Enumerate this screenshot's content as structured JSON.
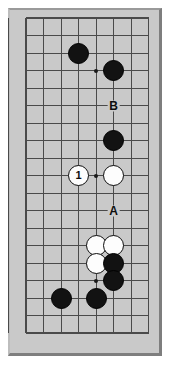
{
  "diagram": {
    "kind": "go-board-diagram",
    "board_color": "#c9c9c9",
    "line_color": "#4a4a4a",
    "black_stone_color": "#121212",
    "white_stone_color": "#fdfdfd",
    "width": 172,
    "height": 371,
    "grid": {
      "origin_x": 26,
      "origin_y": 18,
      "spacing": 17.5,
      "columns": 8,
      "rows": 19,
      "col_xs": [
        26,
        43.5,
        61,
        78.5,
        96,
        113.5,
        131,
        148.5
      ],
      "row_ys": [
        18,
        35.5,
        53,
        70.5,
        88,
        105.5,
        123,
        140.5,
        158,
        175.5,
        193,
        210.5,
        228,
        245.5,
        263,
        280.5,
        298,
        315.5,
        333
      ],
      "left_edge_x": 18,
      "right_edge_x": 148.5,
      "top_edge_y": 18,
      "bottom_edge_y": 333
    },
    "hoshi": [
      {
        "name": "star-point-upper",
        "x": 96,
        "y": 70.5
      },
      {
        "name": "star-point-middle",
        "x": 96,
        "y": 175.5
      },
      {
        "name": "star-point-lower",
        "x": 96,
        "y": 280.5
      }
    ],
    "stones": [
      {
        "name": "black-stone-upper-left",
        "color": "black",
        "x": 78.5,
        "y": 53,
        "label": ""
      },
      {
        "name": "black-stone-upper-right",
        "color": "black",
        "x": 113.5,
        "y": 70.5,
        "label": ""
      },
      {
        "name": "black-stone-upper-middle",
        "color": "black",
        "x": 113.5,
        "y": 140.5,
        "label": ""
      },
      {
        "name": "white-stone-move-1",
        "color": "white",
        "x": 78.5,
        "y": 175.5,
        "label": "1"
      },
      {
        "name": "white-stone-center",
        "color": "white",
        "x": 113.5,
        "y": 175.5,
        "label": ""
      },
      {
        "name": "white-stone-lower-cluster-top-left",
        "color": "white",
        "x": 96,
        "y": 245.5,
        "label": ""
      },
      {
        "name": "white-stone-lower-cluster-top-right",
        "color": "white",
        "x": 113.5,
        "y": 245.5,
        "label": ""
      },
      {
        "name": "white-stone-lower-cluster-left",
        "color": "white",
        "x": 96,
        "y": 263,
        "label": ""
      },
      {
        "name": "black-stone-lower-cluster-right",
        "color": "black",
        "x": 113.5,
        "y": 263,
        "label": ""
      },
      {
        "name": "black-stone-lower-right",
        "color": "black",
        "x": 113.5,
        "y": 280.5,
        "label": ""
      },
      {
        "name": "black-stone-bottom-left",
        "color": "black",
        "x": 61,
        "y": 298,
        "label": ""
      },
      {
        "name": "black-stone-bottom-middle",
        "color": "black",
        "x": 96,
        "y": 298,
        "label": ""
      }
    ],
    "labels": [
      {
        "name": "point-label-b",
        "text": "B",
        "x": 113.5,
        "y": 105.5
      },
      {
        "name": "point-label-a",
        "text": "A",
        "x": 113.5,
        "y": 210.5
      }
    ],
    "move_numbers": {
      "move_1": "1"
    }
  }
}
